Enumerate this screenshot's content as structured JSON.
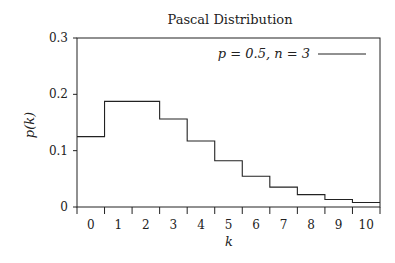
{
  "chart_data": {
    "type": "line",
    "style": "step",
    "title": "Pascal Distribution",
    "xlabel": "k",
    "ylabel": "p(k)",
    "x": [
      0,
      1,
      2,
      3,
      4,
      5,
      6,
      7,
      8,
      9,
      10
    ],
    "series": [
      {
        "name": "p = 0.5, n = 3",
        "values": [
          0.125,
          0.1875,
          0.1875,
          0.15625,
          0.1172,
          0.082,
          0.0547,
          0.0352,
          0.022,
          0.0134,
          0.0081
        ]
      }
    ],
    "xticks": [
      "0",
      "1",
      "2",
      "3",
      "4",
      "5",
      "6",
      "7",
      "8",
      "9",
      "10"
    ],
    "yticks": [
      "0",
      "0.1",
      "0.2",
      "0.3"
    ],
    "xlim": [
      -0.5,
      10.5
    ],
    "ylim": [
      0,
      0.3
    ],
    "grid": false,
    "legend_position": "upper right"
  }
}
